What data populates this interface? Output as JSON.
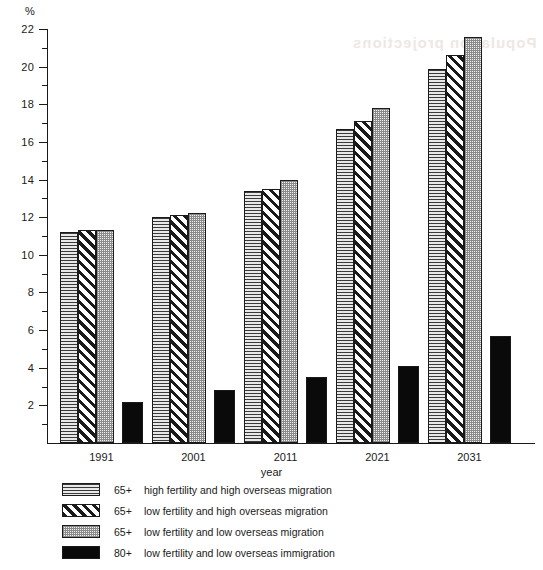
{
  "chart_data": {
    "type": "bar",
    "title": "",
    "xlabel": "year",
    "ylabel": "%",
    "ylim": [
      0,
      22
    ],
    "ytick_step": 2,
    "yminor_step": 1,
    "grid": false,
    "legend_position": "below-plot",
    "categories": [
      "1991",
      "2001",
      "2011",
      "2021",
      "2031"
    ],
    "series": [
      {
        "name": "65+  high fertility and high overseas migration",
        "age_group": "65+",
        "description": "high fertility and high overseas migration",
        "pattern": "horizontal-lines",
        "values": [
          11.2,
          12.0,
          13.4,
          16.7,
          19.9
        ]
      },
      {
        "name": "65+  low fertility and high overseas migration",
        "age_group": "65+",
        "description": "low fertility and high overseas migration",
        "pattern": "diagonal-stripes",
        "values": [
          11.3,
          12.1,
          13.5,
          17.1,
          20.6
        ]
      },
      {
        "name": "65+  low fertility and low overseas migration",
        "age_group": "65+",
        "description": "low fertility and low overseas migration",
        "pattern": "stipple",
        "values": [
          11.3,
          12.2,
          14.0,
          17.8,
          21.6
        ]
      },
      {
        "name": "80+  low fertility and low overseas immigration",
        "age_group": "80+",
        "description": "low fertility and low overseas immigration",
        "pattern": "solid-black",
        "values": [
          2.2,
          2.8,
          3.5,
          4.1,
          5.7
        ]
      }
    ],
    "ytick_labels": [
      "22",
      "20",
      "18",
      "16",
      "14",
      "12",
      "10",
      "8",
      "6",
      "4",
      "2"
    ]
  },
  "axis": {
    "unit_label": "%",
    "x_title": "year"
  },
  "legend": {
    "rows": [
      {
        "age": "65+",
        "text": "high fertility and high overseas migration",
        "pattern": "horizontal-lines"
      },
      {
        "age": "65+",
        "text": "low fertility and high overseas migration",
        "pattern": "diagonal-stripes"
      },
      {
        "age": "65+",
        "text": "low fertility and low overseas migration",
        "pattern": "stipple"
      },
      {
        "age": "80+",
        "text": "low fertility and low overseas immigration",
        "pattern": "solid-black"
      }
    ]
  },
  "artifact": {
    "ghost_text": "Population projections"
  }
}
